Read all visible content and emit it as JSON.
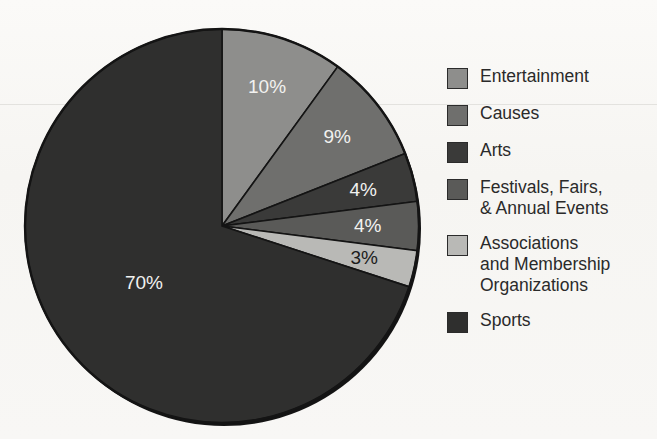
{
  "chart_data": {
    "type": "pie",
    "title": "",
    "subtitle": "",
    "xlabel": "",
    "ylabel": "",
    "legend_position": "right",
    "grid": false,
    "units": "percent",
    "categories": [
      "Entertainment",
      "Causes",
      "Arts",
      "Festivals, Fairs,\n& Annual Events",
      "Associations\nand Membership\nOrganizations",
      "Sports"
    ],
    "values": [
      10,
      9,
      4,
      4,
      3,
      70
    ],
    "value_labels": [
      "10%",
      "9%",
      "4%",
      "4%",
      "3%",
      "70%"
    ],
    "colors": [
      "#8e8e8c",
      "#6f6f6d",
      "#3a3a39",
      "#5a5a58",
      "#b9b9b6",
      "#2f2f2e"
    ],
    "label_text_colors": [
      "#f2f2f0",
      "#f2f2f0",
      "#f2f2f0",
      "#f2f2f0",
      "#1c1c1c",
      "#f2f2f0"
    ],
    "start_angle_deg": 0,
    "direction": "clockwise",
    "slices": [
      {
        "name": "Entertainment",
        "value": 10,
        "label": "10%",
        "color": "#8e8e8c",
        "label_color": "light"
      },
      {
        "name": "Causes",
        "value": 9,
        "label": "9%",
        "color": "#6f6f6d",
        "label_color": "light"
      },
      {
        "name": "Arts",
        "value": 4,
        "label": "4%",
        "color": "#3a3a39",
        "label_color": "light"
      },
      {
        "name": "Festivals, Fairs, & Annual Events",
        "value": 4,
        "label": "4%",
        "color": "#5a5a58",
        "label_color": "light"
      },
      {
        "name": "Associations and Membership Organizations",
        "value": 3,
        "label": "3%",
        "color": "#b9b9b6",
        "label_color": "dark"
      },
      {
        "name": "Sports",
        "value": 70,
        "label": "70%",
        "color": "#2f2f2e",
        "label_color": "light"
      }
    ]
  },
  "legend": {
    "items": [
      {
        "label": "Entertainment",
        "color": "#8e8e8c"
      },
      {
        "label": "Causes",
        "color": "#6f6f6d"
      },
      {
        "label": "Arts",
        "color": "#3a3a39"
      },
      {
        "label": "Festivals, Fairs,\n& Annual Events",
        "color": "#5a5a58"
      },
      {
        "label": "Associations\nand Membership\nOrganizations",
        "color": "#b9b9b6"
      },
      {
        "label": "Sports",
        "color": "#2f2f2e"
      }
    ]
  },
  "style": {
    "background": "#f7f6f3",
    "outline": "#141414",
    "divider": "#141414"
  }
}
